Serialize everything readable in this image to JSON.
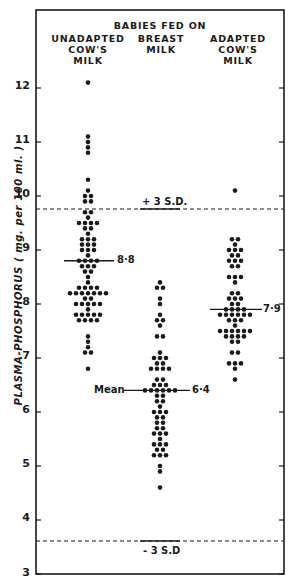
{
  "chart_data": {
    "type": "scatter",
    "subtype": "dot-plot",
    "title": "BABIES FED ON",
    "xlabel": "",
    "ylabel": "PLASMA-PHOSPHORUS ( mg. per 100 ml. )",
    "ylim": [
      3,
      12.5
    ],
    "yticks": [
      3,
      4,
      5,
      6,
      7,
      8,
      9,
      10,
      11,
      12
    ],
    "grid": false,
    "legend": "none",
    "categories": [
      "UNADAPTED COW'S MILK",
      "BREAST MILK",
      "ADAPTED COW'S MILK"
    ],
    "reference_lines": [
      {
        "label": "+ 3 S.D.",
        "value": 9.2,
        "style": "dashed"
      },
      {
        "label": "- 3 S.D.",
        "value": 3.6,
        "style": "dashed"
      }
    ],
    "series": [
      {
        "name": "UNADAPTED COW'S MILK",
        "mean": 8.8,
        "mean_label": "8·8",
        "rows": [
          {
            "v": 12.1,
            "n": 1
          },
          {
            "v": 11.1,
            "n": 1
          },
          {
            "v": 11.0,
            "n": 1
          },
          {
            "v": 10.9,
            "n": 1
          },
          {
            "v": 10.8,
            "n": 1
          },
          {
            "v": 10.3,
            "n": 1
          },
          {
            "v": 10.1,
            "n": 1
          },
          {
            "v": 10.0,
            "n": 2
          },
          {
            "v": 9.9,
            "n": 2
          },
          {
            "v": 9.7,
            "n": 2
          },
          {
            "v": 9.6,
            "n": 1
          },
          {
            "v": 9.5,
            "n": 4
          },
          {
            "v": 9.4,
            "n": 2
          },
          {
            "v": 9.3,
            "n": 1
          },
          {
            "v": 9.2,
            "n": 3
          },
          {
            "v": 9.1,
            "n": 3
          },
          {
            "v": 9.0,
            "n": 3
          },
          {
            "v": 8.9,
            "n": 1
          },
          {
            "v": 8.8,
            "n": 4
          },
          {
            "v": 8.7,
            "n": 3
          },
          {
            "v": 8.6,
            "n": 2
          },
          {
            "v": 8.5,
            "n": 1
          },
          {
            "v": 8.4,
            "n": 1
          },
          {
            "v": 8.3,
            "n": 4
          },
          {
            "v": 8.2,
            "n": 7
          },
          {
            "v": 8.1,
            "n": 2
          },
          {
            "v": 8.0,
            "n": 5
          },
          {
            "v": 7.9,
            "n": 1
          },
          {
            "v": 7.8,
            "n": 5
          },
          {
            "v": 7.7,
            "n": 4
          },
          {
            "v": 7.4,
            "n": 1
          },
          {
            "v": 7.3,
            "n": 1
          },
          {
            "v": 7.2,
            "n": 1
          },
          {
            "v": 7.1,
            "n": 2
          },
          {
            "v": 6.8,
            "n": 1
          }
        ]
      },
      {
        "name": "BREAST MILK",
        "mean": 6.4,
        "mean_label": "6·4",
        "rows": [
          {
            "v": 8.4,
            "n": 1
          },
          {
            "v": 8.3,
            "n": 2
          },
          {
            "v": 8.1,
            "n": 1
          },
          {
            "v": 8.0,
            "n": 1
          },
          {
            "v": 7.8,
            "n": 1
          },
          {
            "v": 7.7,
            "n": 2
          },
          {
            "v": 7.6,
            "n": 1
          },
          {
            "v": 7.4,
            "n": 2
          },
          {
            "v": 7.1,
            "n": 1
          },
          {
            "v": 7.0,
            "n": 3
          },
          {
            "v": 6.9,
            "n": 2
          },
          {
            "v": 6.8,
            "n": 4
          },
          {
            "v": 6.6,
            "n": 2
          },
          {
            "v": 6.5,
            "n": 3
          },
          {
            "v": 6.4,
            "n": 6
          },
          {
            "v": 6.3,
            "n": 2
          },
          {
            "v": 6.2,
            "n": 2
          },
          {
            "v": 6.1,
            "n": 1
          },
          {
            "v": 6.0,
            "n": 3
          },
          {
            "v": 5.9,
            "n": 2
          },
          {
            "v": 5.8,
            "n": 2
          },
          {
            "v": 5.7,
            "n": 2
          },
          {
            "v": 5.6,
            "n": 3
          },
          {
            "v": 5.5,
            "n": 1
          },
          {
            "v": 5.4,
            "n": 3
          },
          {
            "v": 5.3,
            "n": 2
          },
          {
            "v": 5.2,
            "n": 3
          },
          {
            "v": 5.0,
            "n": 1
          },
          {
            "v": 4.9,
            "n": 1
          },
          {
            "v": 4.6,
            "n": 1
          }
        ]
      },
      {
        "name": "ADAPTED COW'S MILK",
        "mean": 7.9,
        "mean_label": "7·9",
        "rows": [
          {
            "v": 10.1,
            "n": 1
          },
          {
            "v": 9.2,
            "n": 2
          },
          {
            "v": 9.1,
            "n": 1
          },
          {
            "v": 9.0,
            "n": 3
          },
          {
            "v": 8.9,
            "n": 2
          },
          {
            "v": 8.8,
            "n": 3
          },
          {
            "v": 8.7,
            "n": 2
          },
          {
            "v": 8.5,
            "n": 3
          },
          {
            "v": 8.4,
            "n": 1
          },
          {
            "v": 8.2,
            "n": 2
          },
          {
            "v": 8.1,
            "n": 3
          },
          {
            "v": 8.0,
            "n": 2
          },
          {
            "v": 7.9,
            "n": 4
          },
          {
            "v": 7.8,
            "n": 6
          },
          {
            "v": 7.7,
            "n": 3
          },
          {
            "v": 7.6,
            "n": 1
          },
          {
            "v": 7.5,
            "n": 6
          },
          {
            "v": 7.4,
            "n": 4
          },
          {
            "v": 7.3,
            "n": 2
          },
          {
            "v": 7.1,
            "n": 2
          },
          {
            "v": 6.9,
            "n": 3
          },
          {
            "v": 6.8,
            "n": 1
          },
          {
            "v": 6.6,
            "n": 1
          }
        ]
      }
    ]
  },
  "header": {
    "title": "BABIES FED ON",
    "col1_line1": "UNADAPTED",
    "col1_line2": "COW'S",
    "col1_line3": "MILK",
    "col2_line1": "BREAST",
    "col2_line2": "MILK",
    "col3_line1": "ADAPTED",
    "col3_line2": "COW'S",
    "col3_line3": "MILK"
  },
  "axis": {
    "ylabel": "PLASMA-PHOSPHORUS ( mg. per 100 ml. )",
    "ticks": [
      "12",
      "11",
      "10",
      "9",
      "8",
      "7",
      "6",
      "5",
      "4",
      "3"
    ]
  },
  "annotations": {
    "plus_sd": "+ 3 S.D.",
    "minus_sd": "- 3 S.D",
    "mean_word": "Mean",
    "mean1": "8·8",
    "mean2": "6·4",
    "mean3": "7·9"
  },
  "colors": {
    "ink": "#1a1a1a",
    "background": "#ffffff"
  }
}
